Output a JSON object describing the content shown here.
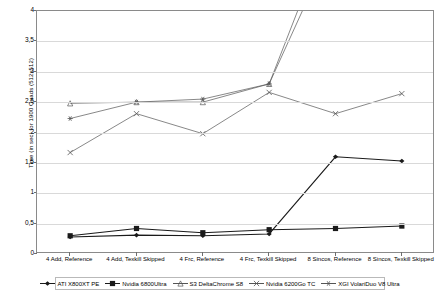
{
  "chart_data": {
    "type": "line",
    "title": "",
    "xlabel": "",
    "ylabel": "Time (in sec) for 1900 Quads (512x512)",
    "ylim": [
      0,
      4
    ],
    "yticks": [
      0,
      0.5,
      1,
      1.5,
      2,
      2.5,
      3,
      3.5,
      4
    ],
    "ytick_labels": [
      "0",
      "0,5",
      "1",
      "1,5",
      "2",
      "2,5",
      "3",
      "3,5",
      "4"
    ],
    "grid": true,
    "legend_position": "bottom",
    "categories": [
      "4 Add, Reference",
      "4 Add, Texkill Skipped",
      "4 Frc, Reference",
      "4 Frc, Texkill Skipped",
      "8 Sincos, Reference",
      "8 Sincos, Texkill Skipped"
    ],
    "series": [
      {
        "name": "ATI X800XT PE",
        "color": "#1a1a1a",
        "marker": "diamond",
        "values": [
          0.28,
          0.31,
          0.3,
          0.33,
          1.6,
          1.53
        ]
      },
      {
        "name": "Nvidia 6800Ultra",
        "color": "#1a1a1a",
        "marker": "square",
        "values": [
          0.3,
          0.42,
          0.35,
          0.4,
          0.42,
          0.46
        ]
      },
      {
        "name": "S3 DeltaChrome S8",
        "color": "#555555",
        "marker": "triangle",
        "values": [
          2.48,
          2.5,
          2.5,
          2.8,
          5.2,
          7.4
        ]
      },
      {
        "name": "Nvidia 6200Go TC",
        "color": "#555555",
        "marker": "cross",
        "values": [
          1.67,
          2.31,
          1.98,
          2.66,
          2.31,
          2.64
        ]
      },
      {
        "name": "XGI VolariDuo V8 Ultra",
        "color": "#555555",
        "marker": "star",
        "values": [
          2.23,
          2.5,
          2.55,
          2.8,
          5.6,
          7.9
        ]
      }
    ]
  },
  "legend": {
    "items": [
      {
        "label": "ATI X800XT PE"
      },
      {
        "label": "Nvidia 6800Ultra"
      },
      {
        "label": "S3 DeltaChrome S8"
      },
      {
        "label": "Nvidia 6200Go TC"
      },
      {
        "label": "XGI VolariDuo V8 Ultra"
      }
    ]
  }
}
